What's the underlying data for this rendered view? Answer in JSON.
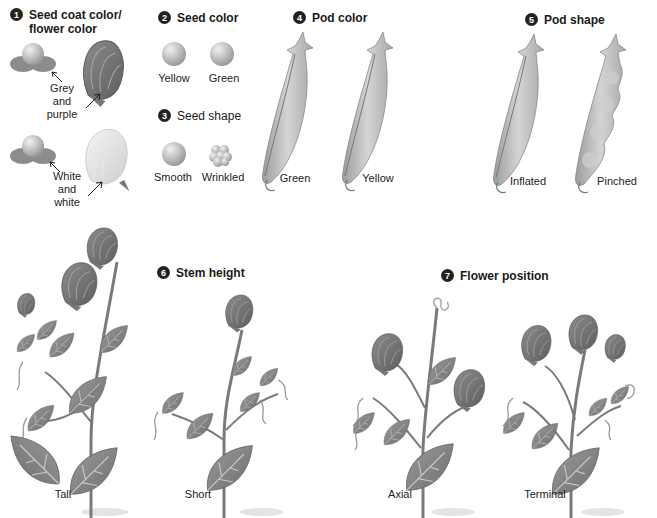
{
  "figure": {
    "sections": [
      {
        "number": "1",
        "title_line1": "Seed coat color/",
        "title_line2": "flower color",
        "variants": [
          {
            "label_lines": [
              "Grey",
              "and",
              "purple"
            ]
          },
          {
            "label_lines": [
              "White",
              "and",
              "white"
            ]
          }
        ]
      },
      {
        "number": "2",
        "title": "Seed color",
        "variants": [
          "Yellow",
          "Green"
        ]
      },
      {
        "number": "3",
        "title": "Seed shape",
        "variants": [
          "Smooth",
          "Wrinkled"
        ]
      },
      {
        "number": "4",
        "title": "Pod color",
        "variants": [
          "Green",
          "Yellow"
        ]
      },
      {
        "number": "5",
        "title": "Pod shape",
        "variants": [
          "Inflated",
          "Pinched"
        ]
      },
      {
        "number": "6",
        "title": "Stem height",
        "variants": [
          "Tall",
          "Short"
        ]
      },
      {
        "number": "7",
        "title": "Flower position",
        "variants": [
          "Axial",
          "Terminal"
        ]
      }
    ]
  },
  "colors": {
    "badge": "#222222",
    "pod": "#b8b8b8",
    "leaf": "#8a8a8a",
    "flower_dark": "#7a7a7a",
    "flower_light": "#e4e4e4"
  }
}
